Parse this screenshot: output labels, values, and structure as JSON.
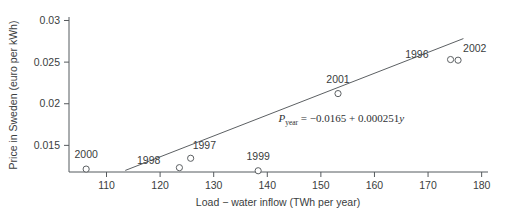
{
  "chart_data": {
    "type": "scatter",
    "title": "",
    "xlabel": "Load − water inflow (TWh per year)",
    "ylabel": "Price in Sweden (euro per kWh)",
    "xlim": [
      103,
      181
    ],
    "ylim": [
      0.0118,
      0.0303
    ],
    "xticks": [
      110,
      120,
      130,
      140,
      150,
      160,
      170,
      180
    ],
    "xticklabels": [
      "110",
      "120",
      "130",
      "140",
      "150",
      "160",
      "170",
      "180"
    ],
    "yticks": [
      0.015,
      0.02,
      0.025,
      0.03
    ],
    "yticklabels": [
      "0.015",
      "0.02",
      "0.025",
      "0.03"
    ],
    "grid": false,
    "legend": "none",
    "marker": "open-circle",
    "points": [
      {
        "label": "2000",
        "x": 106.2,
        "y": 0.01215,
        "label_dx": 0,
        "label_dy": -11
      },
      {
        "label": "1998",
        "x": 123.6,
        "y": 0.01232,
        "label_dx": -19,
        "label_dy": -4
      },
      {
        "label": "1997",
        "x": 125.7,
        "y": 0.01345,
        "label_dx": 2,
        "label_dy": -9
      },
      {
        "label": "1999",
        "x": 138.3,
        "y": 0.01195,
        "label_dx": 0,
        "label_dy": -11
      },
      {
        "label": "2001",
        "x": 153.2,
        "y": 0.02122,
        "label_dx": 0,
        "label_dy": -11
      },
      {
        "label": "1996",
        "x": 174.2,
        "y": 0.02531,
        "label_dx": -22,
        "label_dy": -2
      },
      {
        "label": "2002",
        "x": 175.6,
        "y": 0.02523,
        "label_dx": 5,
        "label_dy": -8
      }
    ],
    "fit": {
      "intercept": -0.0165,
      "slope": 0.000251,
      "x_start": 113.5,
      "x_end": 176.6,
      "equation_plain": "P_year = -0.0165 + 0.000251y",
      "equation_parts": {
        "p": "P",
        "subscript": "year",
        "eq": "=",
        "body": "−0.0165 + 0.000251",
        "variable": "y"
      },
      "equation_x": 153.8,
      "equation_y": 0.01775
    },
    "colors": {
      "axis": "#555a5e",
      "marker_edge": "#5c6063",
      "marker_fill": "#ffffff",
      "fit_line": "#5c6063",
      "text": "#3a3d40",
      "background": "#ffffff"
    }
  }
}
